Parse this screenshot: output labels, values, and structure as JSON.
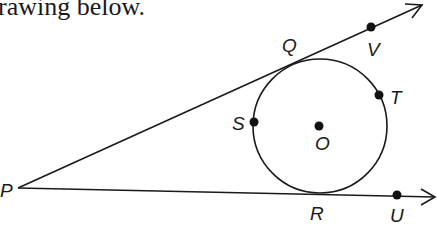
{
  "caption": "rawing below.",
  "figure": {
    "stroke_color": "#1a1a1a",
    "circle": {
      "center_label": "O",
      "cx": 320,
      "cy": 126,
      "r": 67
    },
    "vertex": {
      "label": "P",
      "x": 18,
      "y": 188
    },
    "points": [
      {
        "label": "Q",
        "x": 290,
        "y": 61
      },
      {
        "label": "V",
        "x": 371,
        "y": 27
      },
      {
        "label": "S",
        "x": 254,
        "y": 122
      },
      {
        "label": "T",
        "x": 379,
        "y": 95
      },
      {
        "label": "O",
        "x": 319,
        "y": 126
      },
      {
        "label": "R",
        "x": 318,
        "y": 193
      },
      {
        "label": "U",
        "x": 397,
        "y": 195
      }
    ],
    "rays": [
      {
        "from": "P",
        "through": "Q",
        "to": "V",
        "tip": [
          422,
          5
        ]
      },
      {
        "from": "P",
        "through": "R",
        "to": "U",
        "tip": [
          435,
          197
        ]
      }
    ]
  },
  "labels": {
    "P": "P",
    "Q": "Q",
    "V": "V",
    "S": "S",
    "T": "T",
    "O": "O",
    "R": "R",
    "U": "U"
  }
}
